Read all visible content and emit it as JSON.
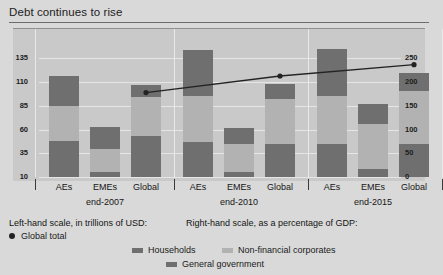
{
  "title": "Debt continues to rise",
  "footnotes": {
    "left_scale": "Left-hand scale, in trillions of USD:",
    "right_scale": "Right-hand scale, as a percentage of GDP:"
  },
  "legend": [
    {
      "key": "global-total",
      "label": "Global total",
      "marker": "dot",
      "color": "#232323"
    },
    {
      "key": "households",
      "label": "Households",
      "marker": "swatch",
      "color": "#6f6f6f"
    },
    {
      "key": "nfc",
      "label": "Non-financial corporates",
      "marker": "swatch",
      "color": "#b2b2b2"
    },
    {
      "key": "government",
      "label": "General government",
      "marker": "swatch",
      "color": "#6f6f6f"
    }
  ],
  "chart_data": {
    "type": "bar",
    "title": "Debt continues to rise",
    "xlabel": "",
    "ylabel": "",
    "stacked": true,
    "grid": true,
    "legend_position": "bottom",
    "categories": [
      "AEs",
      "EMEs",
      "Global",
      "AEs",
      "EMEs",
      "Global",
      "AEs",
      "EMEs",
      "Global"
    ],
    "groups": [
      {
        "label": "end-2007",
        "categories": [
          "AEs",
          "EMEs",
          "Global"
        ]
      },
      {
        "label": "end-2010",
        "categories": [
          "AEs",
          "EMEs",
          "Global"
        ]
      },
      {
        "label": "end-2015",
        "categories": [
          "AEs",
          "EMEs",
          "Global"
        ]
      }
    ],
    "left_axis": {
      "label": "Left-hand scale, in trillions of USD",
      "ticks": [
        135,
        110,
        85,
        60,
        35,
        10
      ],
      "ylim": [
        10,
        145
      ]
    },
    "right_axis": {
      "label": "Right-hand scale, as a percentage of GDP",
      "ticks": [
        250,
        200,
        150,
        100,
        50,
        0
      ],
      "ylim": [
        0,
        270
      ]
    },
    "series": [
      {
        "name": "Households",
        "color": "#6f6f6f",
        "values": [
          38,
          5,
          43,
          37,
          5,
          35,
          35,
          8,
          35
        ]
      },
      {
        "name": "Non-financial corporates",
        "color": "#b2b2b2",
        "values": [
          37,
          25,
          41,
          48,
          30,
          47,
          50,
          48,
          56
        ]
      },
      {
        "name": "General government",
        "color": "#6f6f6f",
        "values": [
          32,
          23,
          13,
          49,
          17,
          16,
          50,
          21,
          19
        ]
      }
    ],
    "bar_totals": [
      117,
      63,
      97,
      134,
      62,
      98,
      135,
      77,
      110
    ],
    "line_series": {
      "name": "Global total",
      "color": "#232323",
      "axis": "right",
      "points": [
        {
          "x": "end-2007 Global",
          "y": 178
        },
        {
          "x": "end-2010 Global",
          "y": 213
        },
        {
          "x": "end-2015 Global",
          "y": 237
        }
      ]
    }
  }
}
